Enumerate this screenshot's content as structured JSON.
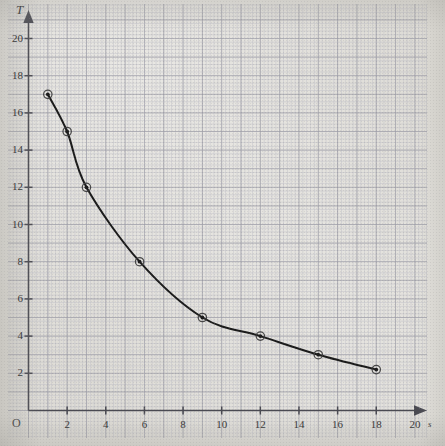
{
  "chart_data": {
    "type": "line",
    "title": "",
    "subtitle": "",
    "xlabel": "s",
    "ylabel": "T",
    "origin_label": "O",
    "grid": true,
    "grid_style": "graph-paper",
    "legend": "none",
    "xlim": [
      0,
      21.5
    ],
    "ylim": [
      0,
      21.8
    ],
    "xticks": [
      2,
      4,
      6,
      8,
      10,
      12,
      14,
      16,
      18,
      20
    ],
    "yticks": [
      2,
      4,
      6,
      8,
      10,
      12,
      14,
      16,
      18,
      20
    ],
    "xtick_labels": [
      "2",
      "4",
      "6",
      "8",
      "10",
      "12",
      "14",
      "16",
      "18",
      "20"
    ],
    "ytick_labels": [
      "2",
      "4",
      "6",
      "8",
      "10",
      "12",
      "14",
      "16",
      "18",
      "20"
    ],
    "x": [
      1,
      2,
      3,
      5.75,
      9,
      12,
      15,
      18
    ],
    "y": [
      17,
      15,
      12,
      8,
      5,
      4,
      3,
      2.2
    ],
    "series": [
      {
        "name": "T vs s",
        "marker": "circle-open-with-dot",
        "values": [
          17,
          15,
          12,
          8,
          5,
          4,
          3,
          2.2
        ]
      }
    ],
    "points": [
      {
        "x": 1,
        "y": 17
      },
      {
        "x": 2,
        "y": 15
      },
      {
        "x": 3,
        "y": 12
      },
      {
        "x": 5.75,
        "y": 8
      },
      {
        "x": 9,
        "y": 5
      },
      {
        "x": 12,
        "y": 4
      },
      {
        "x": 15,
        "y": 3
      },
      {
        "x": 18,
        "y": 2.2
      }
    ],
    "curve_description": "smooth monotonically decreasing decay curve through the plotted points",
    "colors": {
      "curve": "#1b1b1b",
      "marker_fill": "#1b1b1b",
      "marker_edge": "#3a3a3a",
      "axis": "#4a4a52",
      "major_grid": "#9b9aa4",
      "minor_grid": "#bfbec6",
      "paper": "#dedcd6",
      "text": "#3a3a3a"
    }
  },
  "axes": {
    "y_axis_name": "y-axis",
    "x_axis_name": "x-axis"
  }
}
